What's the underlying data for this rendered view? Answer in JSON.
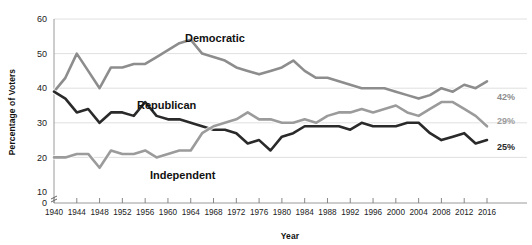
{
  "chart_data": {
    "type": "line",
    "title": "",
    "xlabel": "Year",
    "ylabel": "Percentage of Voters",
    "xlim": [
      1940,
      2016
    ],
    "ylim": [
      10,
      60
    ],
    "grid": true,
    "legend_position": "inline-annotations",
    "y_ticks": [
      0,
      10,
      20,
      30,
      40,
      50,
      60
    ],
    "y_axis_break": true,
    "x_ticks": [
      1940,
      1944,
      1948,
      1952,
      1956,
      1960,
      1964,
      1968,
      1972,
      1976,
      1980,
      1984,
      1988,
      1992,
      1996,
      2000,
      2004,
      2008,
      2012,
      2016
    ],
    "x": [
      1940,
      1942,
      1944,
      1946,
      1948,
      1950,
      1952,
      1954,
      1956,
      1958,
      1960,
      1962,
      1964,
      1966,
      1968,
      1970,
      1972,
      1974,
      1976,
      1978,
      1980,
      1982,
      1984,
      1986,
      1988,
      1990,
      1992,
      1994,
      1996,
      1998,
      2000,
      2002,
      2004,
      2006,
      2008,
      2010,
      2012,
      2014,
      2016
    ],
    "series": [
      {
        "name": "Democratic",
        "color": "#8d8d8d",
        "end_label": "42%",
        "end_value": 42,
        "values": [
          39,
          43,
          50,
          45,
          40,
          46,
          46,
          47,
          47,
          49,
          51,
          53,
          54,
          50,
          49,
          48,
          46,
          45,
          44,
          45,
          46,
          48,
          45,
          43,
          43,
          42,
          41,
          40,
          40,
          40,
          39,
          38,
          37,
          38,
          40,
          39,
          41,
          40,
          42
        ]
      },
      {
        "name": "Republican",
        "color": "#2a2a2a",
        "end_label": "25%",
        "end_value": 25,
        "values": [
          39,
          37,
          33,
          34,
          30,
          33,
          33,
          32,
          36,
          32,
          31,
          31,
          30,
          29,
          28,
          28,
          27,
          24,
          25,
          22,
          26,
          27,
          29,
          29,
          29,
          29,
          28,
          30,
          29,
          29,
          29,
          30,
          30,
          27,
          25,
          26,
          27,
          24,
          25
        ]
      },
      {
        "name": "Independent",
        "color": "#9b9b9b",
        "end_label": "29%",
        "end_value": 29,
        "values": [
          20,
          20,
          21,
          21,
          17,
          22,
          21,
          21,
          22,
          20,
          21,
          22,
          22,
          27,
          29,
          30,
          31,
          33,
          31,
          31,
          30,
          30,
          31,
          30,
          32,
          33,
          33,
          34,
          33,
          34,
          35,
          33,
          32,
          34,
          36,
          36,
          34,
          32,
          29
        ]
      }
    ],
    "annotations": [
      {
        "text": "Democratic",
        "x_px": 185,
        "y_px": 42
      },
      {
        "text": "Republican",
        "x_px": 137,
        "y_px": 109
      },
      {
        "text": "Independent",
        "x_px": 150,
        "y_px": 179
      }
    ]
  }
}
